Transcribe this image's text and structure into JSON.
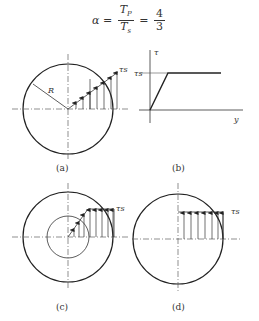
{
  "formula": {
    "lhs": "α",
    "eq": "=",
    "frac1_num": "T",
    "frac1_num_sub": "P",
    "frac1_den": "T",
    "frac1_den_sub": "s",
    "eq2": "=",
    "frac2_num": "4",
    "frac2_den": "3"
  },
  "figures": {
    "a": {
      "caption": "(a)",
      "radius_label": "R",
      "stress_label": "τs"
    },
    "b": {
      "caption": "(b)",
      "y_axis_label": "τ",
      "yield_label": "τs",
      "x_axis_label": "y"
    },
    "c": {
      "caption": "(c)",
      "stress_label": "τs"
    },
    "d": {
      "caption": "(d)",
      "stress_label": "τs"
    }
  },
  "colors": {
    "line": "#222222",
    "thin": "#555555"
  }
}
